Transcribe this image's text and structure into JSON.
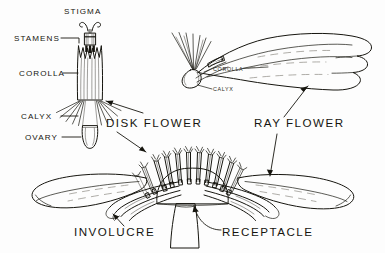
{
  "figure": {
    "background_color": "#fdfdfd",
    "ink_color": "#16150f",
    "vein_color": "#8d8a82"
  },
  "labels": {
    "stigma": "STIGMA",
    "stamens": "STAMENS",
    "corolla": "COROLLA",
    "calyx": "CALYX",
    "ovary": "OVARY",
    "disk_flower": "DISK FLOWER",
    "ray_flower": "RAY FLOWER",
    "ray_corolla": "COROLLA",
    "ray_calyx": "CALYX",
    "involucre": "INVOLUCRE",
    "receptacle": "RECEPTACLE"
  },
  "parts": {
    "disk_floret": "disk-floret-enlarged",
    "ray_floret": "ray-floret-enlarged",
    "flower_head": "flower-head-section",
    "receptacle_dome": "receptacle-dome",
    "involucre_bracts": "involucre-bracts",
    "ray_petal_left": "ray-petal-left",
    "ray_petal_right": "ray-petal-right",
    "stem": "stem"
  },
  "counts": {
    "disk_florets_on_head": 11,
    "ray_petal_lobes": 3,
    "stigma_lobes": 2,
    "corolla_lobes": 5
  }
}
